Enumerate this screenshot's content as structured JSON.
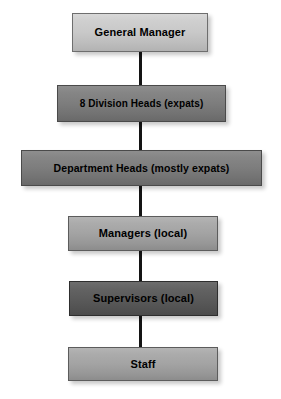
{
  "diagram": {
    "type": "organizational-hierarchy",
    "background_color": "#ffffff",
    "connector_color": "#141414",
    "text_color": "#000000",
    "nodes": [
      {
        "id": "general-manager",
        "label": "General Manager",
        "level": 1,
        "tone": "light",
        "fill_color": "#c9c9c9",
        "x": 72,
        "y": 13,
        "width": 136,
        "height": 39,
        "font_size": 11
      },
      {
        "id": "division-heads",
        "label": "8 Division Heads (expats)",
        "level": 2,
        "tone": "dark",
        "fill_color": "#7d7d7d",
        "x": 57,
        "y": 85,
        "width": 169,
        "height": 37,
        "font_size": 10
      },
      {
        "id": "department-heads",
        "label": "Department Heads (mostly expats)",
        "level": 3,
        "tone": "dark",
        "fill_color": "#7d7d7d",
        "x": 21,
        "y": 150,
        "width": 241,
        "height": 36,
        "font_size": 10.5
      },
      {
        "id": "managers",
        "label": "Managers (local)",
        "level": 4,
        "tone": "medium",
        "fill_color": "#a3a3a3",
        "x": 68,
        "y": 216,
        "width": 150,
        "height": 35,
        "font_size": 11
      },
      {
        "id": "supervisors",
        "label": "Supervisors (local)",
        "level": 5,
        "tone": "darkest",
        "fill_color": "#5b5b5b",
        "x": 69,
        "y": 281,
        "width": 149,
        "height": 35,
        "font_size": 11
      },
      {
        "id": "staff",
        "label": "Staff",
        "level": 6,
        "tone": "medium",
        "fill_color": "#a3a3a3",
        "x": 68,
        "y": 347,
        "width": 150,
        "height": 34,
        "font_size": 11
      }
    ],
    "connectors": [
      {
        "id": "gm-to-division-heads",
        "from": "general-manager",
        "to": "division-heads",
        "x": 139,
        "y": 52,
        "length": 33
      },
      {
        "id": "division-to-department",
        "from": "division-heads",
        "to": "department-heads",
        "x": 139,
        "y": 122,
        "length": 28
      },
      {
        "id": "department-to-managers",
        "from": "department-heads",
        "to": "managers",
        "x": 139,
        "y": 186,
        "length": 30
      },
      {
        "id": "managers-to-supervisors",
        "from": "managers",
        "to": "supervisors",
        "x": 139,
        "y": 251,
        "length": 30
      },
      {
        "id": "supervisors-to-staff",
        "from": "supervisors",
        "to": "staff",
        "x": 139,
        "y": 316,
        "length": 31
      }
    ]
  }
}
